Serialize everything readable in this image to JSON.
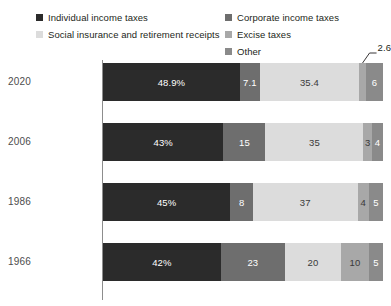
{
  "legend": {
    "columns": [
      {
        "items": [
          {
            "label": "Individual income taxes",
            "color": "#2b2b2b",
            "swatch_name": "legend-swatch-individual-income-taxes"
          },
          {
            "label": "Social insurance and retirement receipts",
            "color": "#dcdcdc",
            "swatch_name": "legend-swatch-social-insurance"
          }
        ]
      },
      {
        "items": [
          {
            "label": "Corporate income taxes",
            "color": "#6e6e6e",
            "swatch_name": "legend-swatch-corporate-income-taxes"
          },
          {
            "label": "Excise taxes",
            "color": "#a8a8a8",
            "swatch_name": "legend-swatch-excise-taxes"
          },
          {
            "label": "Other",
            "color": "#8a8a8a",
            "swatch_name": "legend-swatch-other"
          }
        ]
      }
    ]
  },
  "rows": [
    {
      "year": "2020",
      "segments": [
        {
          "label": "48.9%",
          "value": 48.9,
          "color": "#2b2b2b",
          "text_on": "dark",
          "visible": true
        },
        {
          "label": "7.1",
          "value": 7.1,
          "color": "#6e6e6e",
          "text_on": "dark",
          "visible": true
        },
        {
          "label": "35.4",
          "value": 35.4,
          "color": "#dcdcdc",
          "text_on": "light",
          "visible": true
        },
        {
          "label": "2.6",
          "value": 2.6,
          "color": "#a8a8a8",
          "text_on": "light",
          "visible": false
        },
        {
          "label": "6",
          "value": 6.0,
          "color": "#8a8a8a",
          "text_on": "dark",
          "visible": true
        }
      ],
      "callout": {
        "text": "2.6",
        "segment_index": 3
      }
    },
    {
      "year": "2006",
      "segments": [
        {
          "label": "43%",
          "value": 43,
          "color": "#2b2b2b",
          "text_on": "dark",
          "visible": true
        },
        {
          "label": "15",
          "value": 15,
          "color": "#6e6e6e",
          "text_on": "dark",
          "visible": true
        },
        {
          "label": "35",
          "value": 35,
          "color": "#dcdcdc",
          "text_on": "light",
          "visible": true
        },
        {
          "label": "3",
          "value": 3,
          "color": "#a8a8a8",
          "text_on": "light",
          "visible": true
        },
        {
          "label": "4",
          "value": 4,
          "color": "#8a8a8a",
          "text_on": "dark",
          "visible": true
        }
      ],
      "callout": null
    },
    {
      "year": "1986",
      "segments": [
        {
          "label": "45%",
          "value": 45,
          "color": "#2b2b2b",
          "text_on": "dark",
          "visible": true
        },
        {
          "label": "8",
          "value": 8,
          "color": "#6e6e6e",
          "text_on": "dark",
          "visible": true
        },
        {
          "label": "37",
          "value": 37,
          "color": "#dcdcdc",
          "text_on": "light",
          "visible": true
        },
        {
          "label": "4",
          "value": 4,
          "color": "#a8a8a8",
          "text_on": "light",
          "visible": true
        },
        {
          "label": "5",
          "value": 5,
          "color": "#8a8a8a",
          "text_on": "dark",
          "visible": true
        }
      ],
      "callout": null
    },
    {
      "year": "1966",
      "segments": [
        {
          "label": "42%",
          "value": 42,
          "color": "#2b2b2b",
          "text_on": "dark",
          "visible": true
        },
        {
          "label": "23",
          "value": 23,
          "color": "#6e6e6e",
          "text_on": "dark",
          "visible": true
        },
        {
          "label": "20",
          "value": 20,
          "color": "#dcdcdc",
          "text_on": "light",
          "visible": true
        },
        {
          "label": "10",
          "value": 10,
          "color": "#a8a8a8",
          "text_on": "light",
          "visible": true
        },
        {
          "label": "5",
          "value": 5,
          "color": "#8a8a8a",
          "text_on": "dark",
          "visible": true
        }
      ],
      "callout": null
    }
  ],
  "chart_data": {
    "type": "bar",
    "orientation": "horizontal",
    "stacked": true,
    "normalized_100pct": true,
    "title": "",
    "subtitle": "",
    "xlabel": "",
    "ylabel": "",
    "categories": [
      "2020",
      "2006",
      "1986",
      "1966"
    ],
    "category_order_top_to_bottom": [
      "2020",
      "2006",
      "1986",
      "1966"
    ],
    "series": [
      {
        "name": "Individual income taxes",
        "color": "#2b2b2b",
        "values": [
          48.9,
          43,
          45,
          42
        ]
      },
      {
        "name": "Corporate income taxes",
        "color": "#6e6e6e",
        "values": [
          7.1,
          15,
          8,
          23
        ]
      },
      {
        "name": "Social insurance and retirement receipts",
        "color": "#dcdcdc",
        "values": [
          35.4,
          35,
          37,
          20
        ]
      },
      {
        "name": "Excise taxes",
        "color": "#a8a8a8",
        "values": [
          2.6,
          3,
          4,
          10
        ]
      },
      {
        "name": "Other",
        "color": "#8a8a8a",
        "values": [
          6,
          4,
          5,
          5
        ]
      }
    ],
    "data_labels": {
      "2020": [
        "48.9%",
        "7.1",
        "35.4",
        "2.6",
        "6"
      ],
      "2006": [
        "43%",
        "15",
        "35",
        "3",
        "4"
      ],
      "1986": [
        "45%",
        "8",
        "37",
        "4",
        "5"
      ],
      "1966": [
        "42%",
        "23",
        "20",
        "10",
        "5"
      ]
    },
    "annotations": [
      {
        "text": "2.6",
        "category": "2020",
        "series": "Excise taxes",
        "style": "leader-line callout above bar"
      }
    ],
    "xlim": [
      0,
      100
    ],
    "grid": false,
    "legend_position": "top",
    "legend_entries": [
      "Individual income taxes",
      "Corporate income taxes",
      "Social insurance and retirement receipts",
      "Excise taxes",
      "Other"
    ],
    "units": "percent of total federal receipts"
  }
}
